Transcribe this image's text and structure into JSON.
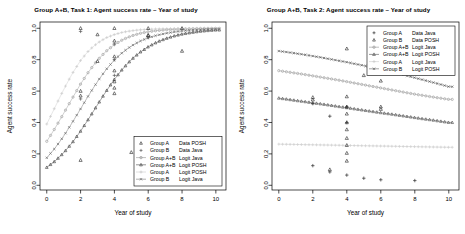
{
  "figure": {
    "background": "#ffffff",
    "panel_count": 2
  },
  "panels": [
    {
      "id": "task1",
      "title": "Group A+B, Task 1: Agent success rate – Year of study",
      "xlabel": "Year of study",
      "ylabel": "Agent success rate",
      "xticks": [
        "0",
        "2",
        "4",
        "6",
        "8",
        "10"
      ],
      "yticks": [
        "0.0",
        "0.2",
        "0.4",
        "0.6",
        "0.8",
        "1.0"
      ],
      "legend": [
        {
          "group": "Group A",
          "series": "Data POSH",
          "marker": "triangle",
          "color": "#2b2b2b",
          "line": false
        },
        {
          "group": "Group B",
          "series": "Data Java",
          "marker": "plus",
          "color": "#555555",
          "line": false
        },
        {
          "group": "Group A+B",
          "series": "Logit Java",
          "marker": "circle",
          "color": "#8c8c8c",
          "line": true
        },
        {
          "group": "Group A+B",
          "series": "Logit POSH",
          "marker": "triangle",
          "color": "#3d3d3d",
          "line": true
        },
        {
          "group": "Group A",
          "series": "Logit POSH",
          "marker": "plus",
          "color": "#c8c8c8",
          "line": true
        },
        {
          "group": "Group B",
          "series": "Logit Java",
          "marker": "cross",
          "color": "#6e6e6e",
          "line": true
        }
      ]
    },
    {
      "id": "task2",
      "title": "Group A+B, Task 2: Agent success rate – Year of study",
      "xlabel": "Year of study",
      "ylabel": "Agent success rate",
      "xticks": [
        "0",
        "2",
        "4",
        "6",
        "8",
        "10"
      ],
      "yticks": [
        "0.0",
        "0.2",
        "0.4",
        "0.6",
        "0.8",
        "1.0"
      ],
      "legend": [
        {
          "group": "Group A",
          "series": "Data Java",
          "marker": "plus",
          "color": "#2b2b2b",
          "line": false
        },
        {
          "group": "Group B",
          "series": "Data POSH",
          "marker": "triangle",
          "color": "#2b2b2b",
          "line": false
        },
        {
          "group": "Group A+B",
          "series": "Logit Java",
          "marker": "circle",
          "color": "#8c8c8c",
          "line": true
        },
        {
          "group": "Group A+B",
          "series": "Logit POSH",
          "marker": "triangle",
          "color": "#4a4a4a",
          "line": true
        },
        {
          "group": "Group A",
          "series": "Logit Java",
          "marker": "plus",
          "color": "#c8c8c8",
          "line": true
        },
        {
          "group": "Group B",
          "series": "Logit POSH",
          "marker": "cross",
          "color": "#5a5a5a",
          "line": true
        }
      ]
    }
  ],
  "chart_data": [
    {
      "type": "scatter",
      "id": "task1",
      "title": "Group A+B, Task 1: Agent success rate – Year of study",
      "xlabel": "Year of study",
      "ylabel": "Agent success rate",
      "xlim": [
        -0.4,
        10.6
      ],
      "ylim": [
        -0.03,
        1.04
      ],
      "xticks": [
        0,
        2,
        4,
        6,
        8,
        10
      ],
      "yticks": [
        0.0,
        0.2,
        0.4,
        0.6,
        0.8,
        1.0
      ],
      "grid": false,
      "legend_position": "bottom-right",
      "series": [
        {
          "name": "Group A Data POSH",
          "type": "scatter",
          "marker": "triangle",
          "color": "#2b2b2b",
          "points": [
            [
              2,
              1.0
            ],
            [
              2,
              0.6
            ],
            [
              2,
              0.57
            ],
            [
              2,
              0.16
            ],
            [
              3,
              0.96
            ],
            [
              3,
              0.79
            ],
            [
              4,
              1.0
            ],
            [
              4,
              0.92
            ],
            [
              4,
              0.82
            ],
            [
              4,
              0.73
            ],
            [
              4,
              0.66
            ],
            [
              4,
              0.62
            ],
            [
              4,
              0.585
            ],
            [
              5,
              0.21
            ],
            [
              6,
              1.0
            ],
            [
              6,
              0.955
            ],
            [
              6,
              0.955
            ],
            [
              8,
              1.0
            ],
            [
              8,
              0.855
            ]
          ]
        },
        {
          "name": "Group B Data Java",
          "type": "scatter",
          "marker": "plus",
          "color": "#555555",
          "points": [
            [
              2,
              0.98
            ],
            [
              2,
              0.55
            ],
            [
              4,
              0.9
            ],
            [
              4,
              0.8
            ],
            [
              4,
              0.7
            ],
            [
              6,
              0.94
            ]
          ]
        },
        {
          "name": "Group A+B Logit Java",
          "type": "line",
          "marker": "circle",
          "color": "#9a9a9a",
          "logistic": {
            "intercept": -0.95,
            "slope": 0.78
          },
          "x": [
            0,
            0.5,
            1,
            1.5,
            2,
            2.5,
            3,
            3.5,
            4,
            4.5,
            5,
            5.5,
            6,
            6.5,
            7,
            7.5,
            8,
            8.5,
            9,
            9.5,
            10
          ],
          "y": [
            0.28,
            0.365,
            0.458,
            0.552,
            0.645,
            0.727,
            0.797,
            0.853,
            0.896,
            0.928,
            0.951,
            0.967,
            0.978,
            0.985,
            0.99,
            0.993,
            0.996,
            0.997,
            0.998,
            0.999,
            0.999
          ]
        },
        {
          "name": "Group A+B Logit POSH",
          "type": "line",
          "marker": "triangle",
          "color": "#3d3d3d",
          "logistic": {
            "intercept": -2.05,
            "slope": 0.7
          },
          "x": [
            0,
            0.5,
            1,
            1.5,
            2,
            2.5,
            3,
            3.5,
            4,
            4.5,
            5,
            5.5,
            6,
            6.5,
            7,
            7.5,
            8,
            8.5,
            9,
            9.5,
            10
          ],
          "y": [
            0.114,
            0.155,
            0.207,
            0.27,
            0.345,
            0.427,
            0.513,
            0.597,
            0.675,
            0.743,
            0.8,
            0.846,
            0.882,
            0.911,
            0.933,
            0.95,
            0.963,
            0.972,
            0.98,
            0.985,
            0.989
          ]
        },
        {
          "name": "Group A Logit POSH",
          "type": "line",
          "marker": "plus",
          "color": "#cccccc",
          "logistic": {
            "intercept": -0.45,
            "slope": 0.9
          },
          "x": [
            0,
            0.5,
            1,
            1.5,
            2,
            2.5,
            3,
            3.5,
            4,
            4.5,
            5,
            5.5,
            6,
            6.5,
            7,
            7.5,
            8,
            8.5,
            9,
            9.5,
            10
          ],
          "y": [
            0.39,
            0.5,
            0.61,
            0.71,
            0.795,
            0.86,
            0.906,
            0.939,
            0.96,
            0.975,
            0.984,
            0.99,
            0.993,
            0.996,
            0.997,
            0.998,
            0.999,
            0.999,
            1.0,
            1.0,
            1.0
          ]
        },
        {
          "name": "Group B Logit Java",
          "type": "line",
          "marker": "cross",
          "color": "#6e6e6e",
          "logistic": {
            "intercept": -1.55,
            "slope": 0.78
          },
          "x": [
            0,
            0.5,
            1,
            1.5,
            2,
            2.5,
            3,
            3.5,
            4,
            4.5,
            5,
            5.5,
            6,
            6.5,
            7,
            7.5,
            8,
            8.5,
            9,
            9.5,
            10
          ],
          "y": [
            0.175,
            0.238,
            0.313,
            0.398,
            0.487,
            0.577,
            0.661,
            0.736,
            0.798,
            0.848,
            0.887,
            0.917,
            0.939,
            0.955,
            0.967,
            0.976,
            0.983,
            0.988,
            0.991,
            0.994,
            0.996
          ]
        }
      ]
    },
    {
      "type": "scatter",
      "id": "task2",
      "title": "Group A+B, Task 2: Agent success rate – Year of study",
      "xlabel": "Year of study",
      "ylabel": "Agent success rate",
      "xlim": [
        -0.4,
        10.6
      ],
      "ylim": [
        -0.03,
        1.04
      ],
      "xticks": [
        0,
        2,
        4,
        6,
        8,
        10
      ],
      "yticks": [
        0.0,
        0.2,
        0.4,
        0.6,
        0.8,
        1.0
      ],
      "grid": false,
      "legend_position": "top-right",
      "series": [
        {
          "name": "Group A Data Java",
          "type": "scatter",
          "marker": "plus",
          "color": "#2b2b2b",
          "points": [
            [
              2,
              0.52
            ],
            [
              2,
              0.125
            ],
            [
              3,
              0.44
            ],
            [
              3,
              0.085
            ],
            [
              4,
              0.5
            ],
            [
              4,
              0.4
            ],
            [
              4,
              0.065
            ],
            [
              5,
              0.045
            ],
            [
              6,
              0.035
            ],
            [
              8,
              0.03
            ]
          ]
        },
        {
          "name": "Group B Data POSH",
          "type": "scatter",
          "marker": "triangle",
          "color": "#2b2b2b",
          "points": [
            [
              2,
              0.56
            ],
            [
              2,
              0.545
            ],
            [
              3,
              0.1
            ],
            [
              4,
              0.87
            ],
            [
              4,
              0.565
            ],
            [
              4,
              0.5
            ],
            [
              4,
              0.455
            ],
            [
              4,
              0.4
            ],
            [
              4,
              0.355
            ],
            [
              4,
              0.3
            ],
            [
              4,
              0.255
            ],
            [
              4,
              0.205
            ],
            [
              4,
              0.155
            ],
            [
              5,
              0.7
            ],
            [
              6,
              0.665
            ],
            [
              6,
              0.5
            ],
            [
              6,
              0.485
            ]
          ]
        },
        {
          "name": "Group A+B Logit Java",
          "type": "line",
          "marker": "circle",
          "color": "#9a9a9a",
          "logistic": {
            "intercept": 0.45,
            "slope": -0.12
          },
          "x": [
            0,
            0.5,
            1,
            1.5,
            2,
            2.5,
            3,
            3.5,
            4,
            4.5,
            5,
            5.5,
            6,
            6.5,
            7,
            7.5,
            8,
            8.5,
            9,
            9.5,
            10
          ],
          "y": [
            0.73,
            0.722,
            0.714,
            0.706,
            0.697,
            0.688,
            0.679,
            0.67,
            0.66,
            0.65,
            0.64,
            0.63,
            0.62,
            0.61,
            0.6,
            0.59,
            0.58,
            0.572,
            0.563,
            0.555,
            0.547
          ]
        },
        {
          "name": "Group A+B Logit POSH",
          "type": "line",
          "marker": "triangle",
          "color": "#4a4a4a",
          "logistic": {
            "intercept": -0.3,
            "slope": -0.12
          },
          "x": [
            0,
            0.5,
            1,
            1.5,
            2,
            2.5,
            3,
            3.5,
            4,
            4.5,
            5,
            5.5,
            6,
            6.5,
            7,
            7.5,
            8,
            8.5,
            9,
            9.5,
            10
          ],
          "y": [
            0.555,
            0.548,
            0.54,
            0.533,
            0.525,
            0.518,
            0.51,
            0.502,
            0.494,
            0.486,
            0.478,
            0.47,
            0.462,
            0.455,
            0.447,
            0.439,
            0.431,
            0.423,
            0.416,
            0.408,
            0.4
          ]
        },
        {
          "name": "Group A Logit Java",
          "type": "line",
          "marker": "plus",
          "color": "#cfcfcf",
          "logistic": {
            "intercept": -1.05,
            "slope": -0.01
          },
          "x": [
            0,
            0.5,
            1,
            1.5,
            2,
            2.5,
            3,
            3.5,
            4,
            4.5,
            5,
            5.5,
            6,
            6.5,
            7,
            7.5,
            8,
            8.5,
            9,
            9.5,
            10
          ],
          "y": [
            0.262,
            0.261,
            0.26,
            0.259,
            0.258,
            0.257,
            0.256,
            0.255,
            0.254,
            0.253,
            0.252,
            0.251,
            0.25,
            0.249,
            0.248,
            0.247,
            0.246,
            0.245,
            0.244,
            0.243,
            0.242
          ]
        },
        {
          "name": "Group B Logit POSH",
          "type": "line",
          "marker": "cross",
          "color": "#5a5a5a",
          "logistic": {
            "intercept": 0.9,
            "slope": -0.14
          },
          "x": [
            0,
            0.5,
            1,
            1.5,
            2,
            2.5,
            3,
            3.5,
            4,
            4.5,
            5,
            5.5,
            6,
            6.5,
            7,
            7.5,
            8,
            8.5,
            9,
            9.5,
            10
          ],
          "y": [
            0.855,
            0.848,
            0.84,
            0.832,
            0.823,
            0.814,
            0.804,
            0.794,
            0.784,
            0.773,
            0.762,
            0.75,
            0.738,
            0.725,
            0.712,
            0.699,
            0.685,
            0.671,
            0.657,
            0.643,
            0.628
          ]
        }
      ]
    }
  ]
}
